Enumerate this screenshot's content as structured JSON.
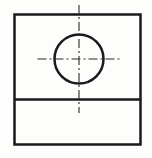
{
  "drawing": {
    "title": "Orthographic part view with centered through-hole",
    "type": "engineering-line-drawing",
    "canvas": {
      "width": 152,
      "height": 158,
      "background": "#fdfdfb"
    },
    "style": {
      "object_line_color": "#1a1a1a",
      "object_line_width": 2.5,
      "center_line_color": "#2b2b2b",
      "center_line_width": 1.1,
      "center_line_dash": "9,3,2,3"
    },
    "outline": {
      "label": "Part outline rectangle",
      "x": 14.5,
      "y": 14.5,
      "width": 126,
      "height": 130,
      "right": 140.5,
      "bottom": 144.5
    },
    "divider": {
      "label": "Horizontal edge line",
      "y": 99.5,
      "x_start": 14.5,
      "x_end": 140.5
    },
    "circle": {
      "label": "Through hole",
      "cx": 79,
      "cy": 59,
      "r": 24.5,
      "diameter": 49
    },
    "center_lines": {
      "vertical": {
        "label": "Vertical center line",
        "x": 79,
        "y_start": 5,
        "y_end": 113
      },
      "horizontal": {
        "label": "Horizontal center line",
        "y": 59,
        "x_start": 37.5,
        "x_end": 121.5
      }
    }
  }
}
